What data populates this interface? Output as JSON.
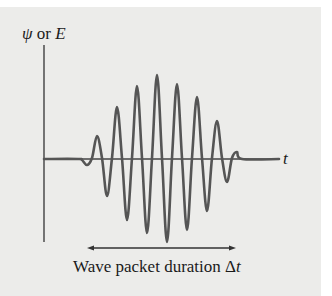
{
  "figure": {
    "y_axis_label_symbol1": "ψ",
    "y_axis_label_or": " or ",
    "y_axis_label_symbol2": "E",
    "x_axis_label": "t",
    "caption_text": "Wave packet duration ",
    "caption_symbol": "Δt",
    "colors": {
      "background": "#ececea",
      "wave": "#555555",
      "axis": "#333333",
      "text": "#1a1a1a"
    }
  },
  "chart_data": {
    "type": "line",
    "title": "",
    "xlabel": "t",
    "ylabel": "ψ or E",
    "axis_origin_px": [
      44,
      159
    ],
    "points_px": [
      [
        44,
        159
      ],
      [
        78,
        159
      ],
      [
        82,
        160
      ],
      [
        87,
        165
      ],
      [
        92,
        158
      ],
      [
        97,
        136
      ],
      [
        102,
        158
      ],
      [
        107,
        196
      ],
      [
        112,
        158
      ],
      [
        117,
        107
      ],
      [
        122,
        158
      ],
      [
        127,
        220
      ],
      [
        132,
        158
      ],
      [
        137,
        86
      ],
      [
        142,
        158
      ],
      [
        147,
        233
      ],
      [
        152,
        158
      ],
      [
        157,
        75
      ],
      [
        162,
        158
      ],
      [
        167,
        242
      ],
      [
        172,
        158
      ],
      [
        177,
        84
      ],
      [
        182,
        158
      ],
      [
        187,
        230
      ],
      [
        192,
        158
      ],
      [
        197,
        97
      ],
      [
        202,
        158
      ],
      [
        207,
        211
      ],
      [
        212,
        158
      ],
      [
        217,
        121
      ],
      [
        222,
        158
      ],
      [
        227,
        182
      ],
      [
        232,
        158
      ],
      [
        237,
        152
      ],
      [
        242,
        159
      ],
      [
        279,
        159
      ]
    ],
    "duration_arrow_px": {
      "x1": 88,
      "x2": 235,
      "y": 248
    }
  }
}
